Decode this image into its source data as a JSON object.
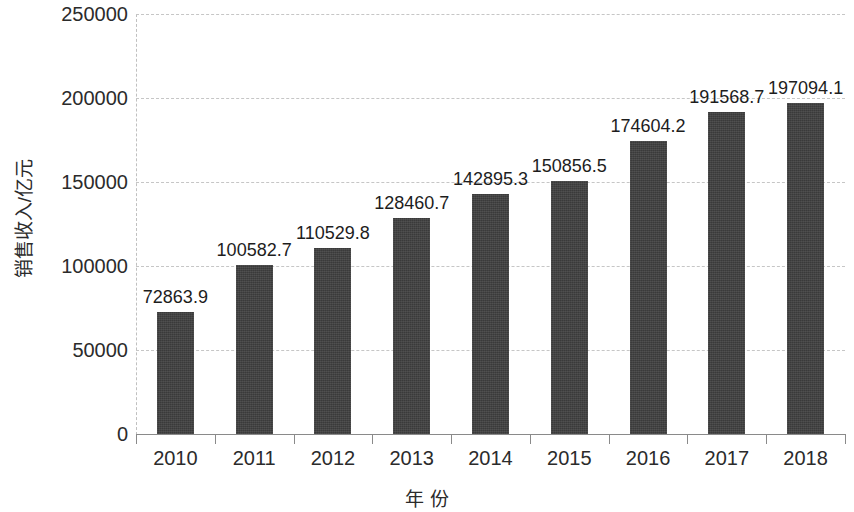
{
  "chart_data": {
    "type": "bar",
    "title": "",
    "xlabel": "年 份",
    "ylabel": "销售收入/亿元",
    "categories": [
      "2010",
      "2011",
      "2012",
      "2013",
      "2014",
      "2015",
      "2016",
      "2017",
      "2018"
    ],
    "values": [
      72863.9,
      100582.7,
      110529.8,
      128460.7,
      142895.3,
      150856.5,
      174604.2,
      191568.7,
      197094.1
    ],
    "value_labels": [
      "72863.9",
      "100582.7",
      "110529.8",
      "128460.7",
      "142895.3",
      "150856.5",
      "174604.2",
      "191568.7",
      "197094.1"
    ],
    "ylim": [
      0,
      250000
    ],
    "ytick_values": [
      0,
      50000,
      100000,
      150000,
      200000,
      250000
    ],
    "ytick_labels": [
      "0",
      "50000",
      "100000",
      "150000",
      "200000",
      "250000"
    ],
    "grid": true,
    "grid_axis": "y",
    "legend": false,
    "legend_position": "none",
    "bar_color": "#3f3f3f",
    "grid_color": "#c6c6c6",
    "text_color": "#2b2b2b"
  }
}
